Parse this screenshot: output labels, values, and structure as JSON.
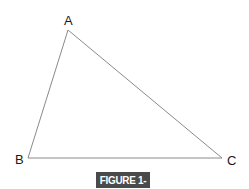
{
  "figure": {
    "type": "triangle",
    "vertices": [
      {
        "label": "A"
      },
      {
        "label": "B"
      },
      {
        "label": "C"
      }
    ],
    "edges": [
      {
        "from": "A",
        "to": "B"
      },
      {
        "from": "B",
        "to": "C"
      },
      {
        "from": "C",
        "to": "A"
      }
    ],
    "stroke_color": "#8a8a8a",
    "caption": "FIGURE 1-15",
    "caption_bg": "#4a4a4a",
    "caption_color": "#ffffff"
  }
}
